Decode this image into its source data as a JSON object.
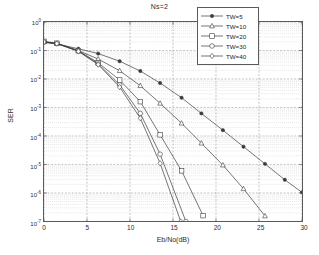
{
  "chart_data": {
    "type": "line",
    "title": "Ns=2",
    "xlabel": "Eb/No(dB)",
    "ylabel": "SER",
    "xlim": [
      0,
      30
    ],
    "ylim": [
      1e-07,
      1
    ],
    "yscale": "log",
    "grid": true,
    "legend_position": "top-right",
    "xticks": [
      "0",
      "5",
      "10",
      "15",
      "20",
      "25",
      "30"
    ],
    "xtick_values": [
      0,
      5,
      10,
      15,
      20,
      25,
      30
    ],
    "yticks": [
      "10^0",
      "10^-1",
      "10^-2",
      "10^-3",
      "10^-4",
      "10^-5",
      "10^-6",
      "10^-7"
    ],
    "ytick_mantissa": "10",
    "ytick_exponents": [
      "0",
      "-1",
      "-2",
      "-3",
      "-4",
      "-5",
      "-6",
      "-7"
    ],
    "ytick_values": [
      1,
      0.1,
      0.01,
      0.001,
      0.0001,
      1e-05,
      1e-06,
      1e-07
    ],
    "series": [
      {
        "name": "TW=5",
        "marker": "filled-dot",
        "color": "#3a3a3a",
        "x": [
          0,
          1.5,
          4,
          6.3,
          8.8,
          11.2,
          13.5,
          16,
          18.3,
          20.8,
          23.2,
          25.7,
          28,
          30
        ],
        "y": [
          0.19,
          0.17,
          0.115,
          0.078,
          0.042,
          0.019,
          0.0072,
          0.0022,
          0.00062,
          0.00016,
          4.2e-05,
          1.05e-05,
          2.9e-06,
          1.05e-06
        ]
      },
      {
        "name": "TW=10",
        "marker": "triangle",
        "color": "#3a3a3a",
        "x": [
          0,
          1.5,
          4,
          6.3,
          8.8,
          11.2,
          13.5,
          16,
          18.3,
          20.8,
          23.2,
          25.7
        ],
        "y": [
          0.2,
          0.175,
          0.1,
          0.05,
          0.0195,
          0.0058,
          0.0014,
          0.00028,
          5.6e-05,
          9.5e-06,
          1.4e-06,
          1.55e-07
        ]
      },
      {
        "name": "TW=20",
        "marker": "square",
        "color": "#3a3a3a",
        "x": [
          0,
          1.5,
          4,
          6.3,
          8.8,
          11.2,
          13.5,
          16,
          18.5
        ],
        "y": [
          0.21,
          0.18,
          0.098,
          0.037,
          0.0092,
          0.0016,
          0.00011,
          6e-06,
          1.6e-07
        ]
      },
      {
        "name": "TW=30",
        "marker": "circle",
        "color": "#3a3a3a",
        "x": [
          0,
          1.5,
          4,
          6.3,
          8.8,
          11.2,
          13.5,
          16.5
        ],
        "y": [
          0.2,
          0.175,
          0.095,
          0.034,
          0.0062,
          0.00062,
          2.3e-05,
          1e-07
        ]
      },
      {
        "name": "TW=40",
        "marker": "diamond",
        "color": "#3a3a3a",
        "x": [
          0,
          1.5,
          4,
          6.3,
          8.8,
          11.2,
          13.5,
          15.9
        ],
        "y": [
          0.2,
          0.175,
          0.093,
          0.032,
          0.0052,
          0.00042,
          1.1e-05,
          1e-07
        ]
      }
    ]
  },
  "legend": {
    "entries": [
      {
        "label": "TW=5"
      },
      {
        "label": "TW=10"
      },
      {
        "label": "TW=20"
      },
      {
        "label": "TW=30"
      },
      {
        "label": "TW=40"
      }
    ]
  }
}
